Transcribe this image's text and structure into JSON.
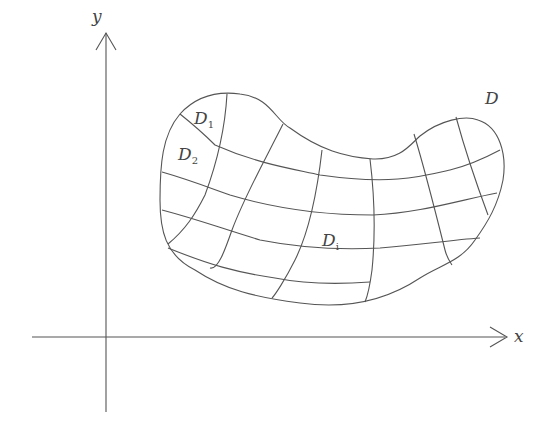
{
  "diagram": {
    "type": "region-partition",
    "axes": {
      "x_label": "x",
      "y_label": "y"
    },
    "region": {
      "label": "D",
      "subregions": [
        {
          "label": "D",
          "subscript": "1"
        },
        {
          "label": "D",
          "subscript": "2"
        },
        {
          "label": "D",
          "subscript": "i"
        }
      ]
    },
    "colors": {
      "line": "#555555",
      "background": "#ffffff"
    }
  }
}
